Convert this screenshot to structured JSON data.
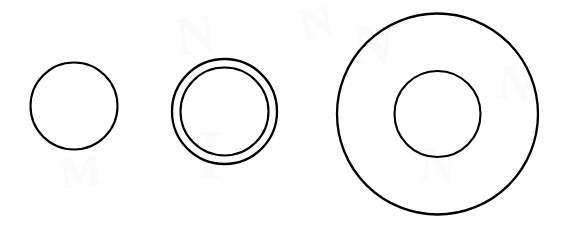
{
  "figure": {
    "background_color": "#ffffff",
    "stroke_color": "#000000",
    "canvas": {
      "width": 564,
      "height": 235
    },
    "ghost_color": "#fbfbfc",
    "groups": [
      {
        "id": "group-1",
        "label": "single-circle",
        "center_x": 74,
        "center_y": 106,
        "rings": [
          {
            "id": "g1-ring-outer",
            "label": "outer-circle",
            "radius": 43.5,
            "stroke_width": 2.1
          }
        ]
      },
      {
        "id": "group-2",
        "label": "double-ring-circle",
        "center_x": 224.5,
        "center_y": 111.5,
        "rings": [
          {
            "id": "g2-ring-outer",
            "label": "outer-circle",
            "radius": 52.5,
            "stroke_width": 2.3
          },
          {
            "id": "g2-ring-inner",
            "label": "inner-circle",
            "radius": 44.0,
            "stroke_width": 2.1
          }
        ]
      },
      {
        "id": "group-3",
        "label": "annulus-circle",
        "center_x": 437.5,
        "center_y": 114,
        "rings": [
          {
            "id": "g3-ring-outer",
            "label": "outer-circle",
            "radius": 100.5,
            "stroke_width": 2.3
          },
          {
            "id": "g3-ring-inner",
            "label": "inner-circle",
            "radius": 43.0,
            "stroke_width": 2.1
          }
        ]
      }
    ],
    "ghost_marks": [
      {
        "id": "ghost-1",
        "glyph": "N",
        "x": 176,
        "y": 8,
        "size": 54,
        "rotate": -8
      },
      {
        "id": "ghost-2",
        "glyph": "N",
        "x": 352,
        "y": 16,
        "size": 58,
        "rotate": 4
      },
      {
        "id": "ghost-3",
        "glyph": "N",
        "x": 300,
        "y": 0,
        "size": 46,
        "rotate": -14
      },
      {
        "id": "ghost-4",
        "glyph": "I",
        "x": 196,
        "y": 120,
        "size": 70,
        "rotate": 2
      },
      {
        "id": "ghost-5",
        "glyph": "N",
        "x": 420,
        "y": 140,
        "size": 50,
        "rotate": 6
      },
      {
        "id": "ghost-6",
        "glyph": "M",
        "x": 60,
        "y": 150,
        "size": 44,
        "rotate": -5
      },
      {
        "id": "ghost-7",
        "glyph": "N",
        "x": 498,
        "y": 60,
        "size": 48,
        "rotate": 9
      }
    ]
  }
}
